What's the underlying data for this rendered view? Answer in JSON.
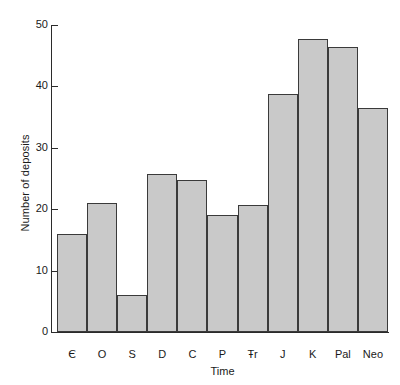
{
  "chart_data": {
    "type": "bar",
    "title": "",
    "xlabel": "Time",
    "ylabel": "Number of deposits",
    "categories": [
      "Є",
      "O",
      "S",
      "D",
      "C",
      "P",
      "Ŧr",
      "J",
      "K",
      "Pal",
      "Neo"
    ],
    "category_names": [
      "Cambrian",
      "Ordovician",
      "Silurian",
      "Devonian",
      "Carboniferous",
      "Permian",
      "Triassic",
      "Jurassic",
      "Cretaceous",
      "Paleogene",
      "Neogene"
    ],
    "values": [
      16,
      21,
      6,
      25.7,
      24.8,
      19,
      20.7,
      38.7,
      47.7,
      46.5,
      36.5
    ],
    "ylim": [
      0,
      50
    ],
    "yticks": [
      0,
      10,
      20,
      30,
      40,
      50
    ],
    "ytick_labels": [
      "0",
      "10",
      "20",
      "30",
      "40",
      "50"
    ],
    "grid": false,
    "legend": false,
    "bar_fill": "#c9c9c9",
    "bar_edge": "#3a3a3a",
    "axis_color": "#2b2b2b",
    "background": "#ffffff"
  }
}
